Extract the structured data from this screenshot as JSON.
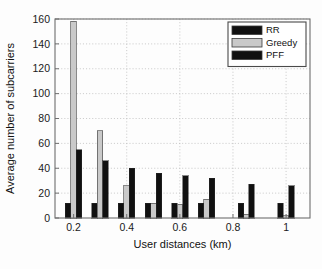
{
  "figure": {
    "background_color": "#fdfdfd",
    "plot_area": {
      "left": 55,
      "top": 19,
      "right": 310,
      "bottom": 218
    }
  },
  "chart_data": {
    "type": "bar",
    "title": "",
    "subtitle": "",
    "xlabel": "User distances (km)",
    "ylabel": "Average number of subcarriers",
    "xlim": [
      0.13,
      1.09
    ],
    "ylim": [
      0,
      160
    ],
    "ytick_labels": [
      "0",
      "20",
      "40",
      "60",
      "80",
      "100",
      "120",
      "140",
      "160"
    ],
    "yticks": [
      0,
      20,
      40,
      60,
      80,
      100,
      120,
      140,
      160
    ],
    "xtick_labels": [
      "0.2",
      "0.4",
      "0.6",
      "0.8",
      "1"
    ],
    "xticks": [
      0.2,
      0.4,
      0.6,
      0.8,
      1.0
    ],
    "grid": true,
    "grid_style": "dotted",
    "legend_position": "upper-right",
    "categories": [
      0.2,
      0.3,
      0.4,
      0.5,
      0.6,
      0.7,
      0.85,
      1.0
    ],
    "series": [
      {
        "name": "RR",
        "color": "#101010",
        "values": [
          12,
          12,
          12,
          12,
          12,
          12,
          12,
          12
        ]
      },
      {
        "name": "Greedy",
        "color": "#c9c9c9",
        "values": [
          158,
          70,
          26,
          12,
          11,
          15,
          3,
          2
        ]
      },
      {
        "name": "PFF",
        "color": "#101010",
        "values": [
          55,
          46,
          40,
          36,
          34,
          32,
          27,
          26
        ]
      }
    ]
  },
  "legend": {
    "entries": [
      {
        "label": "RR",
        "color": "#101010"
      },
      {
        "label": "Greedy",
        "color": "#c9c9c9"
      },
      {
        "label": "PFF",
        "color": "#101010"
      }
    ]
  }
}
